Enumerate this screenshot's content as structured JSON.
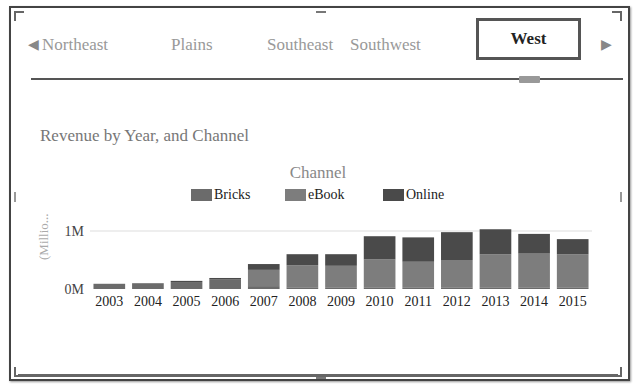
{
  "tabs": {
    "prev_icon": "triangle-left-icon",
    "next_icon": "triangle-right-icon",
    "items": [
      {
        "label": "Northeast",
        "active": false
      },
      {
        "label": "Plains",
        "active": false
      },
      {
        "label": "Southeast",
        "active": false
      },
      {
        "label": "Southwest",
        "active": false
      },
      {
        "label": "West",
        "active": true
      }
    ]
  },
  "colors": {
    "Bricks": "#6b6b6b",
    "eBook": "#7d7d7d",
    "Online": "#4a4a4a",
    "gridline": "#dddddd"
  },
  "chart_data": {
    "type": "bar",
    "stacked": true,
    "title": "Revenue by Year, and Channel",
    "legend_title": "Channel",
    "legend_position": "top-center",
    "xlabel": "",
    "ylabel": "(Millio...",
    "ylim": [
      0,
      1.0
    ],
    "y_ticks": [
      "0M",
      "1M"
    ],
    "y_tick_values": [
      0,
      1.0
    ],
    "grid": true,
    "categories": [
      "2003",
      "2004",
      "2005",
      "2006",
      "2007",
      "2008",
      "2009",
      "2010",
      "2011",
      "2012",
      "2013",
      "2014",
      "2015"
    ],
    "series": [
      {
        "name": "Bricks",
        "values": [
          0.09,
          0.1,
          0.12,
          0.17,
          0.05,
          0.03,
          0.02,
          0.02,
          0.02,
          0.02,
          0.02,
          0.02,
          0.02
        ]
      },
      {
        "name": "eBook",
        "values": [
          0.0,
          0.0,
          0.0,
          0.0,
          0.28,
          0.38,
          0.38,
          0.49,
          0.45,
          0.48,
          0.58,
          0.59,
          0.58
        ]
      },
      {
        "name": "Online",
        "values": [
          0.0,
          0.0,
          0.02,
          0.02,
          0.1,
          0.19,
          0.2,
          0.4,
          0.42,
          0.48,
          0.43,
          0.34,
          0.26
        ]
      }
    ]
  }
}
